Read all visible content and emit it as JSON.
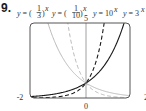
{
  "problem_number": "9.",
  "chart_data": {
    "type": "line",
    "title": "",
    "xlabel": "",
    "ylabel": "",
    "xlim": [
      -2,
      2
    ],
    "ylim": [
      0,
      5
    ],
    "x_tick_labels": [
      "-2",
      "0",
      "2"
    ],
    "y_tick_labels": [
      "5"
    ],
    "grid": false,
    "legend": "top (labels above curves)",
    "series": [
      {
        "name": "y = (1/3)^x",
        "base": 0.3333333,
        "style": "solid",
        "color": "#b8b8b8",
        "label_parts": {
          "pre": "y = (",
          "num": "1",
          "den": "3",
          "post": ")",
          "exp": "x"
        }
      },
      {
        "name": "y = (1/10)^x",
        "base": 0.1,
        "style": "dashed",
        "color": "#b8b8b8",
        "label_parts": {
          "pre": "y = (",
          "num": "1",
          "den": "10",
          "post": ")",
          "exp": "x"
        }
      },
      {
        "name": "y = 10^x",
        "base": 10,
        "style": "dashed",
        "color": "#1a1a1a",
        "label_parts": {
          "pre": "y = 10",
          "exp": "x"
        }
      },
      {
        "name": "y = 3^x",
        "base": 3,
        "style": "solid",
        "color": "#1a1a1a",
        "label_parts": {
          "pre": "y = 3",
          "exp": "x"
        }
      }
    ]
  }
}
